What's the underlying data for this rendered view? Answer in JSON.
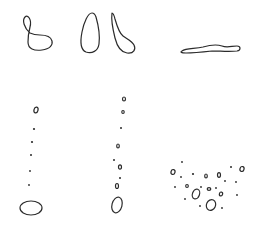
{
  "diagram": {
    "background": "#ffffff",
    "stroke_color": "#2b2b2b",
    "panels": [
      {
        "id": "loop-shape",
        "description": "closed curve with small upper loop"
      },
      {
        "id": "teardrop-shape",
        "description": "elongated teardrop outline"
      },
      {
        "id": "hook-shape",
        "description": "thin stem ending in rounded bulb"
      },
      {
        "id": "flat-shape",
        "description": "long flat wavy outline"
      },
      {
        "id": "dot-column-left",
        "description": "vertical trail of dots ending in large oval"
      },
      {
        "id": "dot-column-middle",
        "description": "vertical trail of small rings and dots ending in oval"
      },
      {
        "id": "dot-cluster",
        "description": "scattered dots and small rings"
      }
    ]
  }
}
